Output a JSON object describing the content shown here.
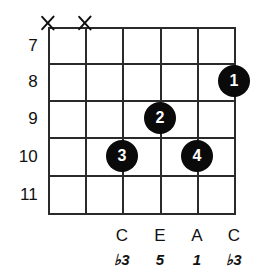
{
  "diagram": {
    "type": "guitar-chord-diagram",
    "grid": {
      "strings": 6,
      "frets": 5,
      "left": 48,
      "right": 234,
      "top": 27,
      "bottom": 213,
      "string_x": [
        48,
        85,
        122,
        160,
        197,
        234
      ],
      "fret_y": [
        27,
        63,
        100,
        137,
        175,
        213
      ],
      "line_color": "#2a2a2a"
    },
    "fret_numbers": [
      {
        "label": "7",
        "y": 45
      },
      {
        "label": "8",
        "y": 81
      },
      {
        "label": "9",
        "y": 118
      },
      {
        "label": "10",
        "y": 156
      },
      {
        "label": "11",
        "y": 194
      }
    ],
    "muted_strings": [
      {
        "marker": "X",
        "x": 48,
        "y": 23
      },
      {
        "marker": "X",
        "x": 85,
        "y": 23
      }
    ],
    "finger_dots": [
      {
        "finger": "1",
        "x": 234,
        "y": 81,
        "string": 6,
        "fret": 8
      },
      {
        "finger": "2",
        "x": 160,
        "y": 118,
        "string": 4,
        "fret": 9
      },
      {
        "finger": "3",
        "x": 122,
        "y": 156,
        "string": 3,
        "fret": 10
      },
      {
        "finger": "4",
        "x": 197,
        "y": 156,
        "string": 5,
        "fret": 10
      }
    ],
    "note_labels": [
      {
        "note": "C",
        "interval": "♭3",
        "x": 122
      },
      {
        "note": "E",
        "interval": "5",
        "x": 160
      },
      {
        "note": "A",
        "interval": "1",
        "x": 197
      },
      {
        "note": "C",
        "interval": "♭3",
        "x": 234
      }
    ],
    "colors": {
      "background": "#ffffff",
      "ink": "#111111",
      "dot_fill": "#0a0a0a",
      "dot_text": "#ffffff"
    }
  }
}
